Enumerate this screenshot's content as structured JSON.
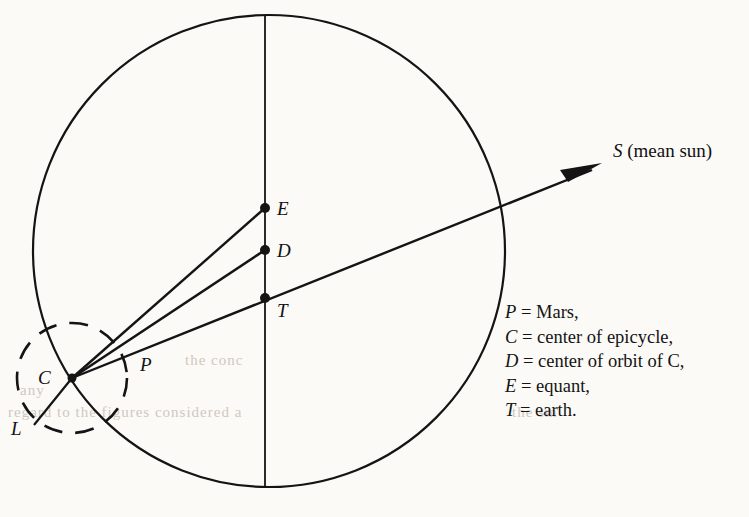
{
  "figure": {
    "background_color": "#fbfaf7",
    "ink_color": "#111111"
  },
  "points": {
    "E": {
      "label": "E",
      "x": 265,
      "y": 208,
      "name": "equant"
    },
    "D": {
      "label": "D",
      "x": 265,
      "y": 250,
      "name": "center of orbit of C"
    },
    "T": {
      "label": "T",
      "x": 265,
      "y": 298,
      "name": "earth"
    },
    "C": {
      "label": "C",
      "x": 72,
      "y": 378,
      "name": "center of epicycle"
    },
    "P": {
      "label": "P",
      "x": 127,
      "y": 372,
      "name": "Mars"
    },
    "L": {
      "label": "L",
      "x": 40,
      "y": 418,
      "name": "epicycle apsidal point"
    },
    "S": {
      "label": "S",
      "x": 600,
      "y": 165,
      "name": "mean sun"
    }
  },
  "sun_label": {
    "symbol": "S",
    "text": " (mean sun)"
  },
  "legend": [
    {
      "symbol": "P",
      "equals": "=",
      "definition": "Mars,"
    },
    {
      "symbol": "C",
      "equals": "=",
      "definition": "center of epicycle,"
    },
    {
      "symbol": "D",
      "equals": "=",
      "definition": "center of orbit of C,"
    },
    {
      "symbol": "E",
      "equals": "=",
      "definition": "equant,"
    },
    {
      "symbol": "T",
      "equals": "=",
      "definition": "earth."
    }
  ],
  "geometry": {
    "deferent": {
      "cx": 269,
      "cy": 251,
      "rx": 236,
      "ry": 236,
      "style": "solid"
    },
    "epicycle": {
      "cx": 72,
      "cy": 378,
      "r": 55,
      "style": "dashed"
    },
    "vertical_axis": {
      "x": 265,
      "y1": 15,
      "y2": 487
    },
    "rays": [
      {
        "from": "C",
        "to": "E"
      },
      {
        "from": "C",
        "to": "D"
      },
      {
        "from": "C",
        "to": "S",
        "through": "T",
        "arrow": true
      },
      {
        "from": "C",
        "to": "L"
      }
    ]
  }
}
